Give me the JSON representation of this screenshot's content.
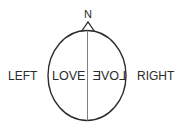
{
  "diagram": {
    "type": "head-top-view",
    "labels": {
      "nose": "N",
      "left": "LEFT",
      "right": "RIGHT",
      "left_hemisphere_text": "LOVE",
      "right_hemisphere_text": "LOVE"
    },
    "right_hemisphere_text_mirrored": true,
    "colors": {
      "outline": "#2b2b2b",
      "midline": "#808080",
      "text": "#2b2b2b",
      "background": "#ffffff"
    }
  }
}
